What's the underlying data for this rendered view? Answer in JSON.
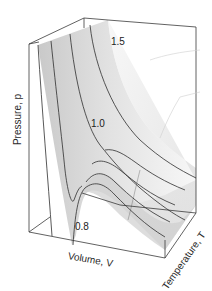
{
  "figure": {
    "type": "3d-surface",
    "axes": {
      "x_label": "Volume, V",
      "y_label": "Temperature, T",
      "z_label": "Pressure, p"
    },
    "isotherm_labels": [
      {
        "value": "1.5"
      },
      {
        "value": "1.0"
      },
      {
        "value": "0.8"
      }
    ],
    "colors": {
      "surface_light": "#f4f4f4",
      "surface_mid": "#d9d9d9",
      "surface_dark": "#bdbdbd",
      "lines": "#333333"
    }
  }
}
